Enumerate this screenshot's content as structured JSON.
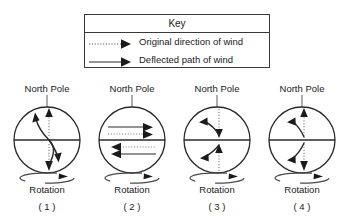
{
  "key": {
    "title": "Key",
    "entries": [
      {
        "style": "dotted",
        "label": "Original direction of wind",
        "icon": "dotted-arrow-right-icon"
      },
      {
        "style": "solid",
        "label": "Deflected path of wind",
        "icon": "solid-arrow-right-icon"
      }
    ]
  },
  "globes": [
    {
      "pole_label": "North Pole",
      "rotation_label": "Rotation",
      "number_label": "( 1 )"
    },
    {
      "pole_label": "North Pole",
      "rotation_label": "Rotation",
      "number_label": "( 2 )"
    },
    {
      "pole_label": "North Pole",
      "rotation_label": "Rotation",
      "number_label": "( 3 )"
    },
    {
      "pole_label": "North Pole",
      "rotation_label": "Rotation",
      "number_label": "( 4 )"
    }
  ],
  "colors": {
    "ink": "#1a1a1a",
    "line": "#3a3a3a",
    "background": "#ffffff"
  }
}
